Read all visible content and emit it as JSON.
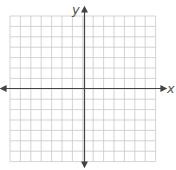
{
  "diagram": {
    "type": "coordinate-plane",
    "x_axis_label": "x",
    "y_axis_label": "y",
    "grid": {
      "columns": 14,
      "rows": 14,
      "left": 10,
      "top": 16,
      "cell": 10.4
    },
    "colors": {
      "grid": "#c8c8c8",
      "axis": "#444444",
      "background": "#ffffff"
    }
  }
}
